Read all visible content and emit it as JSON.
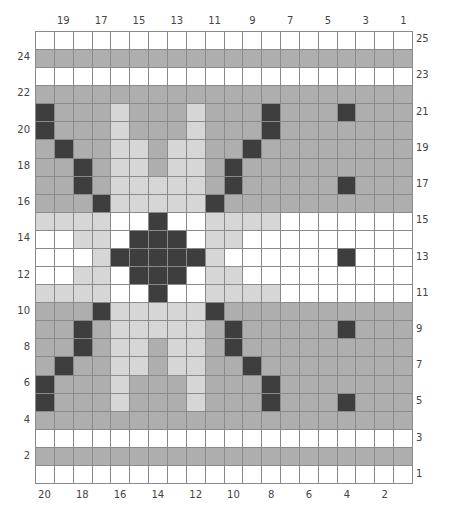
{
  "colors": {
    "W": "#ffffff",
    "M": "#aeaeae",
    "L": "#d6d6d6",
    "D": "#3e3e3e"
  },
  "legend": {
    "W": "white",
    "M": "medium gray",
    "L": "light gray",
    "D": "dark gray"
  },
  "columns": 20,
  "rows": 25,
  "top_labels": [
    "19",
    "17",
    "15",
    "13",
    "11",
    "9",
    "7",
    "5",
    "3",
    "1"
  ],
  "bottom_labels": [
    "20",
    "18",
    "16",
    "14",
    "12",
    "10",
    "8",
    "6",
    "4",
    "2"
  ],
  "left_labels": [
    "24",
    "22",
    "20",
    "18",
    "16",
    "14",
    "12",
    "10",
    "8",
    "6",
    "4",
    "2"
  ],
  "right_labels": [
    "25",
    "23",
    "21",
    "19",
    "17",
    "15",
    "13",
    "11",
    "9",
    "7",
    "5",
    "3",
    "1"
  ],
  "grid": [
    "WWWWWWWWWWWWWWWWWWWW",
    "MMMMMMMMMMMMMMMMMMMM",
    "WWWWWWWWWWWWWWWWWWWW",
    "MMMMMMMMMMMMMMMMMMMM",
    "DMMMLMMMLMMMDMMMDMMM",
    "DMMMLMMMLMMMDMMMMMMM",
    "MDMMLLMLLMMDMMMMMMMM",
    "MMDMLLMLLMDMMMMMMMMM",
    "MMDMLLLLLMDMMMMMDMMM",
    "MMMDLLLLLDMMMMMMMMMM",
    "LLLLWWDWWLLLLWWWWWWW",
    "WWLLWDDDWLLWWWWWWWWW",
    "WWWLDDDDDLWWWWWWDWWW",
    "WWLLWDDDWLLWWWWWWWWW",
    "LLLLWWDWWLLLLWWWWWWW",
    "MMMDLLLLLDMMMMMMMMMM",
    "MMDMLLLLLMDMMMMMDMMM",
    "MMDMLLMLLMDMMMMMMMMM",
    "MDMMLLMLLMMDMMMMMMMM",
    "DMMMLMMMLMMMDMMMMMMM",
    "DMMMLMMMLMMMDMMMDMMM",
    "MMMMMMMMMMMMMMMMMMMM",
    "WWWWWWWWWWWWWWWWWWWW",
    "MMMMMMMMMMMMMMMMMMMM",
    "WWWWWWWWWWWWWWWWWWWW"
  ]
}
